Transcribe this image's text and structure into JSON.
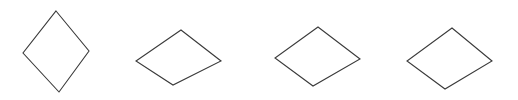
{
  "figure": {
    "title": "",
    "background_color": "#ffffff",
    "stroke_color": "#3a3a3a",
    "fill": "none",
    "stroke_width": 1.1,
    "width": 518,
    "height": 100,
    "shape_count": 4,
    "shape_kind": "rhombus-outline"
  },
  "chart_data": {
    "type": "scatter",
    "title": "",
    "xlabel": "",
    "ylabel": "",
    "xlim": [
      0,
      518
    ],
    "ylim": [
      0,
      100
    ],
    "grid": false,
    "legend": null,
    "series": [
      {
        "name": "rhombus-1",
        "label": "tall narrow diamond",
        "center_x": 56,
        "center_y": 51,
        "half_width": 33,
        "half_height": 40,
        "aspect_ratio": 0.82,
        "vertices": [
          {
            "x": 56,
            "y": 11
          },
          {
            "x": 89,
            "y": 51
          },
          {
            "x": 59,
            "y": 92
          },
          {
            "x": 23,
            "y": 53
          }
        ]
      },
      {
        "name": "rhombus-2",
        "label": "wide flat diamond",
        "center_x": 178,
        "center_y": 57,
        "half_width": 43,
        "half_height": 28,
        "aspect_ratio": 1.52,
        "vertices": [
          {
            "x": 181,
            "y": 30
          },
          {
            "x": 221,
            "y": 61
          },
          {
            "x": 173,
            "y": 85
          },
          {
            "x": 136,
            "y": 61
          }
        ]
      },
      {
        "name": "rhombus-3",
        "label": "wide flat diamond",
        "center_x": 318,
        "center_y": 56,
        "half_width": 43,
        "half_height": 30,
        "aspect_ratio": 1.43,
        "vertices": [
          {
            "x": 318,
            "y": 27
          },
          {
            "x": 360,
            "y": 59
          },
          {
            "x": 313,
            "y": 86
          },
          {
            "x": 275,
            "y": 58
          }
        ]
      },
      {
        "name": "rhombus-4",
        "label": "wide flat diamond",
        "center_x": 450,
        "center_y": 58,
        "half_width": 43,
        "half_height": 31,
        "aspect_ratio": 1.39,
        "vertices": [
          {
            "x": 452,
            "y": 28
          },
          {
            "x": 492,
            "y": 61
          },
          {
            "x": 445,
            "y": 89
          },
          {
            "x": 407,
            "y": 61
          }
        ]
      }
    ]
  }
}
